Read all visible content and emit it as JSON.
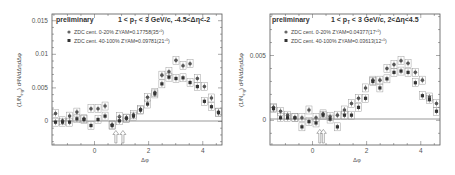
{
  "chart_data": [
    {
      "type": "scatter",
      "panel": "left",
      "title": "preliminary",
      "subtitle": "1 < p_T < 3 GeV/c, -4.5<Δη<-2",
      "xlabel": "Δφ",
      "ylabel": "(1/N_trig) d²N/dΔηdΔφ",
      "xlim": [
        -1.57,
        4.71
      ],
      "ylim": [
        -0.0035,
        0.016
      ],
      "xticks": [
        "0",
        "2",
        "4"
      ],
      "xtick_values": [
        0,
        2,
        4
      ],
      "yticks": [
        "0",
        "0.005",
        "0.01",
        "0.015"
      ],
      "ytick_values": [
        0,
        0.005,
        0.01,
        0.015
      ],
      "grid": false,
      "legend_position": "upper left",
      "arrows_x": [
        0.79,
        1.05
      ],
      "x": [
        -1.44,
        -1.18,
        -0.92,
        -0.65,
        -0.39,
        -0.13,
        0.13,
        0.39,
        0.65,
        0.92,
        1.18,
        1.44,
        1.7,
        1.96,
        2.23,
        2.49,
        2.75,
        3.01,
        3.27,
        3.53,
        3.8,
        4.06,
        4.32,
        4.58
      ],
      "series": [
        {
          "name": "ZDC cent. 0-20% ZYAM=0.17758(35^{+0}_{-0})",
          "values": [
            0.0012,
            0.0001,
            0.0008,
            0.0014,
            0.0004,
            0.0019,
            0.0019,
            0.0023,
            -0.0005,
            0.0007,
            0.0005,
            0.001,
            0.0018,
            0.0036,
            0.0043,
            0.0069,
            0.0074,
            0.0091,
            0.0083,
            0.0086,
            0.0064,
            0.0052,
            0.0035,
            0.0014
          ]
        },
        {
          "name": "ZDC cent. 40-100% ZYAM=0.09781(21^{+0}_{-0})",
          "values": [
            -0.0001,
            -0.0001,
            -0.0001,
            0.0004,
            0.0003,
            -0.0006,
            0.0003,
            0.0008,
            -0.0006,
            0.0001,
            0.0005,
            0.0008,
            0.0017,
            0.0026,
            0.0041,
            0.0056,
            0.0066,
            0.0064,
            0.0065,
            0.0058,
            0.0052,
            0.003,
            0.0022,
            0.0013
          ]
        }
      ]
    },
    {
      "type": "scatter",
      "panel": "right",
      "title": "preliminary",
      "subtitle": "1 < p_T < 3 GeV/c, 2<Δη<4.5",
      "xlabel": "Δφ",
      "ylabel": "(1/N_trig) d²N/dΔηdΔφ",
      "xlim": [
        -1.57,
        4.71
      ],
      "ylim": [
        -0.0019,
        0.0082
      ],
      "xticks": [
        "0",
        "2",
        "4"
      ],
      "xtick_values": [
        0,
        2,
        4
      ],
      "yticks": [
        "0",
        "0.005"
      ],
      "ytick_values": [
        0,
        0.005
      ],
      "grid": false,
      "legend_position": "upper left",
      "arrows_x": [
        0.27,
        0.4
      ],
      "x": [
        -1.44,
        -1.18,
        -0.92,
        -0.65,
        -0.39,
        -0.13,
        0.13,
        0.39,
        0.65,
        0.92,
        1.18,
        1.44,
        1.7,
        1.96,
        2.23,
        2.49,
        2.75,
        3.01,
        3.27,
        3.53,
        3.8,
        4.06,
        4.32,
        4.58
      ],
      "series": [
        {
          "name": "ZDC cent. 0-20% ZYAM=0.04377(17^{+0}_{-0})",
          "values": [
            0.001,
            0.0007,
            0.0004,
            0.0002,
            0.0002,
            0.0008,
            0.0002,
            0.0005,
            0.0003,
            0.0004,
            0.0008,
            0.0013,
            0.0017,
            0.0025,
            0.0031,
            0.0031,
            0.004,
            0.0043,
            0.0046,
            0.0044,
            0.0037,
            0.0031,
            0.0018,
            0.0013
          ]
        },
        {
          "name": "ZDC cent. 40-100% ZYAM=0.03613(12^{+0}_{-0})",
          "values": [
            0.0009,
            0.0002,
            0.0002,
            0.0002,
            -0.0005,
            -0.0001,
            -0.0002,
            0.0004,
            0.0001,
            -0.0005,
            0.0004,
            0.0004,
            0.001,
            0.0017,
            0.003,
            0.0025,
            0.0032,
            0.0037,
            0.0038,
            0.0037,
            0.0029,
            0.0019,
            0.0016,
            0.0007
          ]
        }
      ]
    }
  ],
  "panels": [
    {
      "title": "preliminary",
      "subtitle": "1 < p",
      "subtitle_sub": "T",
      "subtitle_rest": " < 3 GeV/c, -4.5<Δη<-2",
      "legend": [
        "ZDC cent. 0-20% ZYAM=0.17758(35",
        "ZDC cent. 40-100% ZYAM=0.09781(21"
      ],
      "legend_sup": [
        "+0",
        "+0"
      ],
      "legend_sub": [
        "-0",
        "-0"
      ],
      "xlabel": "Δφ",
      "ylabel_a": "(1/N",
      "ylabel_sub": "trig",
      "ylabel_b": ") d²N/dΔηdΔφ",
      "yticks": [
        "0",
        "0.005",
        "0.01",
        "0.015"
      ],
      "xticks": [
        "0",
        "2",
        "4"
      ]
    },
    {
      "title": "preliminary",
      "subtitle": "1 < p",
      "subtitle_sub": "T",
      "subtitle_rest": " < 3 GeV/c, 2<Δη<4.5",
      "legend": [
        "ZDC cent. 0-20% ZYAM=0.04377(17",
        "ZDC cent. 40-100% ZYAM=0.03613(12"
      ],
      "legend_sup": [
        "+0",
        "+0"
      ],
      "legend_sub": [
        "-0",
        "-0"
      ],
      "xlabel": "Δφ",
      "ylabel_a": "(1/N",
      "ylabel_sub": "trig",
      "ylabel_b": ") d²N/dΔηdΔφ",
      "yticks": [
        "0",
        "0.005"
      ],
      "xticks": [
        "0",
        "2",
        "4"
      ]
    }
  ]
}
